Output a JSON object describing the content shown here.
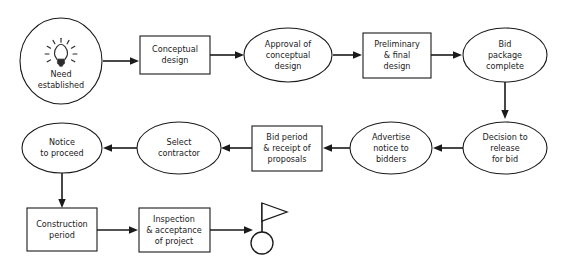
{
  "diagram": {
    "background_color": "#ffffff",
    "stroke_color": "#1a1a1a",
    "nodes": [
      {
        "id": "need_established",
        "label_lines": [
          "Need",
          "established"
        ],
        "shape": "ellipse",
        "icon": "lightbulb-icon"
      },
      {
        "id": "conceptual_design",
        "label_lines": [
          "Conceptual",
          "design"
        ],
        "shape": "rect"
      },
      {
        "id": "approval_conceptual",
        "label_lines": [
          "Approval of",
          "conceptual",
          "design"
        ],
        "shape": "ellipse"
      },
      {
        "id": "prelim_final",
        "label_lines": [
          "Preliminary",
          "& final",
          "design"
        ],
        "shape": "rect"
      },
      {
        "id": "bid_package",
        "label_lines": [
          "Bid",
          "package",
          "complete"
        ],
        "shape": "ellipse"
      },
      {
        "id": "decision_release",
        "label_lines": [
          "Decision to",
          "release",
          "for bid"
        ],
        "shape": "ellipse"
      },
      {
        "id": "advertise_notice",
        "label_lines": [
          "Advertise",
          "notice to",
          "bidders"
        ],
        "shape": "ellipse"
      },
      {
        "id": "bid_period",
        "label_lines": [
          "Bid period",
          "& receipt of",
          "proposals"
        ],
        "shape": "rect"
      },
      {
        "id": "select_contractor",
        "label_lines": [
          "Select",
          "contractor"
        ],
        "shape": "ellipse"
      },
      {
        "id": "notice_proceed",
        "label_lines": [
          "Notice",
          "to proceed"
        ],
        "shape": "ellipse"
      },
      {
        "id": "construction",
        "label_lines": [
          "Construction",
          "period"
        ],
        "shape": "rect"
      },
      {
        "id": "inspection",
        "label_lines": [
          "Inspection",
          "& acceptance",
          "of project"
        ],
        "shape": "rect"
      },
      {
        "id": "finish_flag",
        "label_lines": [],
        "shape": "flag-terminator",
        "icon": "flag-icon"
      }
    ],
    "text": {
      "need_l1": "Need",
      "need_l2": "established",
      "conceptual_l1": "Conceptual",
      "conceptual_l2": "design",
      "approval_l1": "Approval of",
      "approval_l2": "conceptual",
      "approval_l3": "design",
      "prelim_l1": "Preliminary",
      "prelim_l2": "& final",
      "prelim_l3": "design",
      "bidpkg_l1": "Bid",
      "bidpkg_l2": "package",
      "bidpkg_l3": "complete",
      "decision_l1": "Decision to",
      "decision_l2": "release",
      "decision_l3": "for bid",
      "advertise_l1": "Advertise",
      "advertise_l2": "notice to",
      "advertise_l3": "bidders",
      "bidperiod_l1": "Bid period",
      "bidperiod_l2": "& receipt of",
      "bidperiod_l3": "proposals",
      "select_l1": "Select",
      "select_l2": "contractor",
      "notice_l1": "Notice",
      "notice_l2": "to proceed",
      "construction_l1": "Construction",
      "construction_l2": "period",
      "inspection_l1": "Inspection",
      "inspection_l2": "& acceptance",
      "inspection_l3": "of project"
    },
    "connections": [
      {
        "from": "need_established",
        "to": "conceptual_design",
        "direction": "right"
      },
      {
        "from": "conceptual_design",
        "to": "approval_conceptual",
        "direction": "right"
      },
      {
        "from": "approval_conceptual",
        "to": "prelim_final",
        "direction": "right"
      },
      {
        "from": "prelim_final",
        "to": "bid_package",
        "direction": "right"
      },
      {
        "from": "bid_package",
        "to": "decision_release",
        "direction": "down"
      },
      {
        "from": "decision_release",
        "to": "advertise_notice",
        "direction": "left"
      },
      {
        "from": "advertise_notice",
        "to": "bid_period",
        "direction": "left"
      },
      {
        "from": "bid_period",
        "to": "select_contractor",
        "direction": "left"
      },
      {
        "from": "select_contractor",
        "to": "notice_proceed",
        "direction": "left"
      },
      {
        "from": "notice_proceed",
        "to": "construction",
        "direction": "down"
      },
      {
        "from": "construction",
        "to": "inspection",
        "direction": "right"
      },
      {
        "from": "inspection",
        "to": "finish_flag",
        "direction": "right"
      }
    ]
  }
}
